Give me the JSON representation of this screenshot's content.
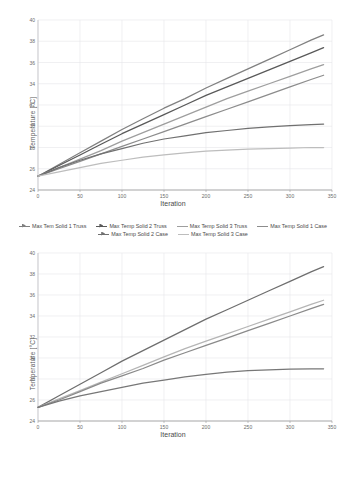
{
  "chart_data": [
    {
      "id": "top",
      "type": "line",
      "title": "",
      "xlabel": "Iteration",
      "ylabel": "Temperature [°C]",
      "xlim": [
        0,
        350
      ],
      "ylim": [
        24,
        40
      ],
      "xticks": [
        "0",
        "50",
        "100",
        "150",
        "200",
        "250",
        "300",
        "350"
      ],
      "yticks": [
        "24",
        "26",
        "28",
        "30",
        "32",
        "34",
        "36",
        "38",
        "40"
      ],
      "grid": true,
      "legend_position": "bottom",
      "x": [
        0,
        25,
        50,
        75,
        100,
        125,
        150,
        175,
        200,
        225,
        250,
        275,
        300,
        325,
        340
      ],
      "series": [
        {
          "name": "Max Tem Solid 1 Truss",
          "color": "#808080",
          "marker": "arrow",
          "values": [
            25.3,
            26.4,
            27.5,
            28.6,
            29.7,
            30.7,
            31.7,
            32.6,
            33.6,
            34.5,
            35.4,
            36.3,
            37.2,
            38.1,
            38.6
          ]
        },
        {
          "name": "Max Temp Solid 2 Truss",
          "color": "#595959",
          "marker": "arrow",
          "values": [
            25.3,
            26.3,
            27.3,
            28.3,
            29.3,
            30.2,
            31.1,
            32.0,
            32.9,
            33.7,
            34.5,
            35.3,
            36.1,
            36.9,
            37.4
          ]
        },
        {
          "name": "Max Temp Solid 3 Truss",
          "color": "#9e9e9e",
          "marker": "line",
          "values": [
            25.3,
            26.1,
            26.9,
            27.7,
            28.6,
            29.4,
            30.2,
            31.0,
            31.8,
            32.6,
            33.3,
            34.0,
            34.7,
            35.4,
            35.8
          ]
        },
        {
          "name": "Max Temp Solid 1 Case",
          "color": "#8c8c8c",
          "marker": "line",
          "values": [
            25.3,
            26.0,
            26.7,
            27.4,
            28.1,
            28.8,
            29.5,
            30.2,
            30.9,
            31.6,
            32.3,
            33.0,
            33.7,
            34.4,
            34.8
          ]
        },
        {
          "name": "Max Temp Solid 2 Case",
          "color": "#707070",
          "marker": "arrow",
          "values": [
            25.3,
            26.1,
            26.8,
            27.4,
            27.9,
            28.4,
            28.8,
            29.1,
            29.4,
            29.6,
            29.8,
            29.95,
            30.05,
            30.15,
            30.2
          ]
        },
        {
          "name": "Max Temp Solid 3 Case",
          "color": "#bdbdbd",
          "marker": "line",
          "values": [
            25.3,
            25.7,
            26.1,
            26.5,
            26.8,
            27.1,
            27.3,
            27.5,
            27.65,
            27.75,
            27.85,
            27.9,
            27.95,
            28.0,
            28.0
          ]
        }
      ]
    },
    {
      "id": "bottom",
      "type": "line",
      "title": "",
      "xlabel": "Iteration",
      "ylabel": "Temperature [°C]",
      "xlim": [
        0,
        350
      ],
      "ylim": [
        24,
        40
      ],
      "xticks": [
        "0",
        "50",
        "100",
        "150",
        "200",
        "250",
        "300",
        "350"
      ],
      "yticks": [
        "24",
        "26",
        "28",
        "30",
        "32",
        "34",
        "36",
        "38",
        "40"
      ],
      "grid": true,
      "legend_position": "bottom",
      "x": [
        0,
        25,
        50,
        75,
        100,
        125,
        150,
        175,
        200,
        225,
        250,
        275,
        300,
        325,
        340
      ],
      "series": [
        {
          "name": "Max Temp Solid 4 Truss",
          "color": "#6e6e6e",
          "marker": "arrow",
          "values": [
            25.3,
            26.4,
            27.5,
            28.6,
            29.7,
            30.7,
            31.7,
            32.7,
            33.7,
            34.6,
            35.5,
            36.4,
            37.3,
            38.2,
            38.7
          ]
        },
        {
          "name": "Max Temp Solid 5 Truss",
          "color": "#b5b5b5",
          "marker": "line",
          "values": [
            25.3,
            26.1,
            26.9,
            27.7,
            28.5,
            29.3,
            30.1,
            30.9,
            31.6,
            32.3,
            33.0,
            33.7,
            34.4,
            35.1,
            35.5
          ]
        },
        {
          "name": "Max Temp Solid 4 Case",
          "color": "#8a8a8a",
          "marker": "arrow",
          "values": [
            25.3,
            26.0,
            26.8,
            27.6,
            28.3,
            29.0,
            29.8,
            30.5,
            31.2,
            31.9,
            32.6,
            33.3,
            34.0,
            34.7,
            35.1
          ]
        },
        {
          "name": "Max Temp Solid 5 Case",
          "color": "#777777",
          "marker": "arrow",
          "values": [
            25.3,
            25.9,
            26.4,
            26.8,
            27.2,
            27.6,
            27.9,
            28.2,
            28.45,
            28.65,
            28.8,
            28.88,
            28.93,
            28.96,
            28.97
          ]
        }
      ]
    }
  ],
  "charts": {
    "top": {
      "xlabel": "Iteration",
      "ylabel": "Temperature [°C]"
    },
    "bottom": {
      "xlabel": "Iteration",
      "ylabel": "Temperature [°C]"
    }
  }
}
